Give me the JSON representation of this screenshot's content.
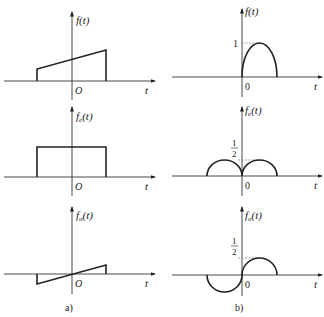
{
  "panels": {
    "a": {
      "caption": "a)",
      "plots": [
        {
          "ylabel": "f(t)",
          "ylabel_main": "f",
          "ylabel_sub": "",
          "ylabel_arg": "(t)",
          "origin": "O",
          "xlabel": "t",
          "shape": "trapezoid ramp: linear rising segment over finite interval"
        },
        {
          "ylabel": "fe(t)",
          "ylabel_main": "f",
          "ylabel_sub": "e",
          "ylabel_arg": "(t)",
          "origin": "O",
          "xlabel": "t",
          "shape": "rectangular pulse (even part)"
        },
        {
          "ylabel": "fo(t)",
          "ylabel_main": "f",
          "ylabel_sub": "o",
          "ylabel_arg": "(t)",
          "origin": "O",
          "xlabel": "t",
          "shape": "odd linear segment through origin"
        }
      ]
    },
    "b": {
      "caption": "b)",
      "plots": [
        {
          "ylabel": "f(t)",
          "ylabel_main": "f",
          "ylabel_sub": "",
          "ylabel_arg": "(t)",
          "origin": "0",
          "xlabel": "t",
          "tick_label": "1",
          "shape": "half-ellipse on t>0, peak 1"
        },
        {
          "ylabel": "fe(t)",
          "ylabel_main": "f",
          "ylabel_sub": "e",
          "ylabel_arg": "(t)",
          "origin": "0",
          "xlabel": "t",
          "tick_label_num": "1",
          "tick_label_den": "2",
          "shape": "two symmetric half-ellipses, peak 1/2"
        },
        {
          "ylabel": "fo(t)",
          "ylabel_main": "f",
          "ylabel_sub": "o",
          "ylabel_arg": "(t)",
          "origin": "0",
          "xlabel": "t",
          "tick_label_num": "1",
          "tick_label_den": "2",
          "shape": "antisymmetric half-ellipses, peak 1/2 and -1/2"
        }
      ]
    }
  }
}
